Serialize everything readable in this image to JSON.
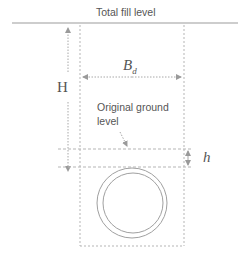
{
  "diagram": {
    "title_label": "Total fill level",
    "height_label": "H",
    "width_label_main": "B",
    "width_label_sub": "d",
    "ground_label_line1": "Original ground",
    "ground_label_line2": "level",
    "depth_label": "h",
    "colors": {
      "line": "#a8a8a8",
      "text": "#555555",
      "solid_line": "#bdbdbd"
    }
  }
}
